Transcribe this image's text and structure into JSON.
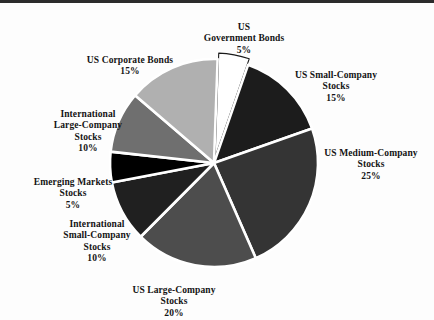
{
  "chart_data": {
    "type": "pie",
    "title": "",
    "subtitle": "",
    "xlabel": "",
    "ylabel": "",
    "legend_position": "none",
    "grid": false,
    "units": "%",
    "center": {
      "x": 214,
      "y": 163
    },
    "radius": 104,
    "start_angle_deg": -88,
    "direction": "clockwise",
    "categories": [
      "US Government Bonds",
      "US Small-Company Stocks",
      "US Medium-Company Stocks",
      "US Large-Company Stocks",
      "International Small-Company Stocks",
      "Emerging Markets Stocks",
      "International Large-Company Stocks",
      "US Corporate Bonds"
    ],
    "values": [
      5,
      15,
      25,
      20,
      10,
      5,
      10,
      15
    ],
    "total": 105,
    "slices": [
      {
        "name": "US Government Bonds",
        "label_line1": "US",
        "label_line2": "Government Bonds",
        "label_line3": "",
        "percent_text": "5%",
        "value": 5,
        "color": "#ffffff",
        "stroke": "#1a1a1a",
        "exploded": true,
        "offset_px": 6
      },
      {
        "name": "US Small-Company Stocks",
        "label_line1": "US Small-Company",
        "label_line2": "Stocks",
        "label_line3": "",
        "percent_text": "15%",
        "value": 15,
        "color": "#1c1c1c",
        "stroke": "#ffffff",
        "exploded": false,
        "offset_px": 0
      },
      {
        "name": "US Medium-Company Stocks",
        "label_line1": "US Medium-Company",
        "label_line2": "Stocks",
        "label_line3": "",
        "percent_text": "25%",
        "value": 25,
        "color": "#343434",
        "stroke": "#ffffff",
        "exploded": false,
        "offset_px": 0
      },
      {
        "name": "US Large-Company Stocks",
        "label_line1": "US Large-Company",
        "label_line2": "Stocks",
        "label_line3": "",
        "percent_text": "20%",
        "value": 20,
        "color": "#4d4d4d",
        "stroke": "#ffffff",
        "exploded": false,
        "offset_px": 0
      },
      {
        "name": "International Small-Company Stocks",
        "label_line1": "International",
        "label_line2": "Small-Company",
        "label_line3": "Stocks",
        "percent_text": "10%",
        "value": 10,
        "color": "#202020",
        "stroke": "#ffffff",
        "exploded": false,
        "offset_px": 0
      },
      {
        "name": "Emerging Markets Stocks",
        "label_line1": "Emerging Markets",
        "label_line2": "Stocks",
        "label_line3": "",
        "percent_text": "5%",
        "value": 5,
        "color": "#000000",
        "stroke": "#ffffff",
        "exploded": false,
        "offset_px": 0
      },
      {
        "name": "International Large-Company Stocks",
        "label_line1": "International",
        "label_line2": "Large-Company",
        "label_line3": "Stocks",
        "percent_text": "10%",
        "value": 10,
        "color": "#6f6f6f",
        "stroke": "#ffffff",
        "exploded": false,
        "offset_px": 0
      },
      {
        "name": "US Corporate Bonds",
        "label_line1": "US Corporate Bonds",
        "label_line2": "",
        "label_line3": "",
        "percent_text": "15%",
        "value": 15,
        "color": "#b0b0b0",
        "stroke": "#ffffff",
        "exploded": false,
        "offset_px": 0
      }
    ]
  },
  "labels": {
    "gov": {
      "text": "US\nGovernment Bonds",
      "pct": "5%"
    },
    "small": {
      "text": "US Small-Company\nStocks",
      "pct": "15%"
    },
    "med": {
      "text": "US Medium-Company\nStocks",
      "pct": "25%"
    },
    "large": {
      "text": "US Large-Company\nStocks",
      "pct": "20%"
    },
    "intsm": {
      "text": "International\nSmall-Company\nStocks",
      "pct": "10%"
    },
    "em": {
      "text": "Emerging Markets\nStocks",
      "pct": "5%"
    },
    "intlg": {
      "text": "International\nLarge-Company\nStocks",
      "pct": "10%"
    },
    "corp": {
      "text": "US Corporate Bonds",
      "pct": "15%"
    }
  },
  "colors": {
    "background": "#fdfdfd",
    "text": "#141414",
    "rule": "#2b2b2b",
    "separator": "#ffffff"
  }
}
